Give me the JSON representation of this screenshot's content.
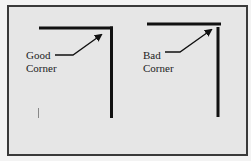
{
  "figure": {
    "panels": [
      {
        "id": "good",
        "label_line1": "Good",
        "label_line2": "Corner",
        "description": "horizontal and vertical lines meet cleanly at corner"
      },
      {
        "id": "bad",
        "label_line1": "Bad",
        "label_line2": "Corner",
        "description": "horizontal and vertical lines do not join cleanly at corner"
      }
    ],
    "colors": {
      "background": "#e6e6e6",
      "border": "#3a3a3a",
      "line": "#111111",
      "text": "#222222"
    }
  }
}
